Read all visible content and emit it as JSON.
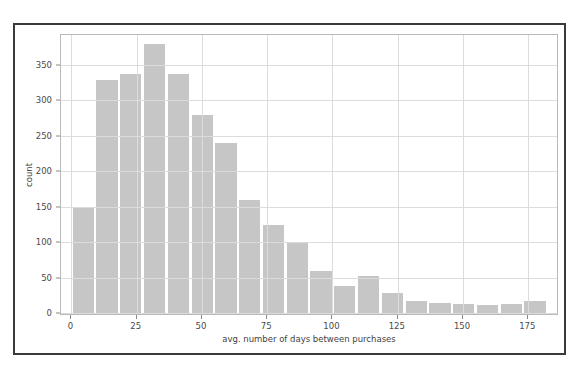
{
  "top_caption": "",
  "colors": {
    "bar_fill": "#c6c6c6",
    "grid": "#dcdcdc",
    "axis_frame": "#b9b9b9",
    "outer_frame": "#3a3a3a",
    "tick_text": "#4a4a4a",
    "background": "#ffffff"
  },
  "chart_data": {
    "type": "bar",
    "title": "",
    "subtitle": "",
    "xlabel": "avg. number of days between purchases",
    "ylabel": "count",
    "xlim": [
      -4,
      186
    ],
    "ylim": [
      0,
      393
    ],
    "grid": true,
    "legend": null,
    "legend_position": "none",
    "bin_width": 9.1,
    "x_tick_labels": [
      "0",
      "25",
      "50",
      "75",
      "100",
      "125",
      "150",
      "175"
    ],
    "x_ticks": [
      0,
      25,
      50,
      75,
      100,
      125,
      150,
      175
    ],
    "y_tick_labels": [
      "0",
      "50",
      "100",
      "150",
      "200",
      "250",
      "300",
      "350"
    ],
    "y_ticks": [
      0,
      50,
      100,
      150,
      200,
      250,
      300,
      350
    ],
    "bin_centers": [
      4.5,
      13.6,
      22.7,
      31.8,
      41.0,
      50.1,
      59.2,
      68.3,
      77.4,
      86.5,
      95.6,
      104.7,
      113.8,
      123.0,
      132.1,
      141.2,
      150.3,
      159.4,
      168.5,
      177.6
    ],
    "categories": [
      "0-9",
      "9-18",
      "18-27",
      "27-36",
      "36-45",
      "45-55",
      "55-64",
      "64-73",
      "73-82",
      "82-91",
      "91-100",
      "100-109",
      "109-118",
      "118-127",
      "127-136",
      "136-146",
      "146-155",
      "155-164",
      "164-173",
      "173-182"
    ],
    "values": [
      151,
      330,
      338,
      380,
      338,
      281,
      241,
      161,
      126,
      100,
      60,
      39,
      53,
      29,
      18,
      15,
      14,
      13,
      14,
      18
    ]
  }
}
